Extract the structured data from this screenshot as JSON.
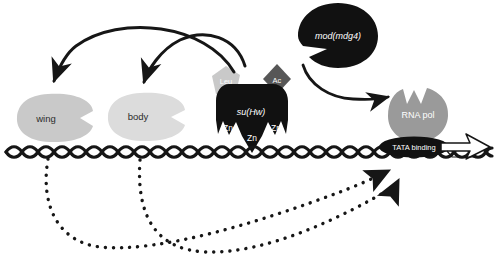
{
  "diagram": {
    "type": "biological-schematic",
    "background_color": "#ffffff"
  },
  "palette": {
    "ink": "#161616",
    "black_protein": "#111111",
    "gray_dark": "#575757",
    "gray_mid": "#9a9a9a",
    "gray_light": "#c9c9c9",
    "gray_lighter": "#dcdcdc",
    "white": "#ffffff",
    "label_dark": "#2b2b2b"
  },
  "enhancers": [
    {
      "id": "wing-enhancer",
      "label": "wing",
      "shape": "pacman-blob",
      "fill": "#c9c9c9",
      "cx": 55,
      "cy": 118,
      "rx": 38,
      "ry": 24,
      "label_x": 46,
      "label_y": 119,
      "font_size": 9.5
    },
    {
      "id": "body-enhancer",
      "label": "body",
      "shape": "pacman-blob",
      "fill": "#dcdcdc",
      "cx": 146,
      "cy": 117,
      "rx": 38,
      "ry": 24,
      "label_x": 138,
      "label_y": 117,
      "font_size": 9.5
    }
  ],
  "su_hw_complex": {
    "label": "su(Hw)",
    "label_x": 251,
    "label_y": 113,
    "font_size": 9,
    "fill": "#111111",
    "subunits": [
      {
        "id": "leu-subunit",
        "label": "Leu",
        "shape": "pentagon",
        "fill": "#c9c9c9",
        "cx": 226,
        "cy": 81,
        "r": 15,
        "label_x": 226,
        "label_y": 82,
        "font_size": 7.5,
        "label_color": "#ffffff"
      },
      {
        "id": "ac-subunit",
        "label": "Ac",
        "shape": "diamond",
        "fill": "#575757",
        "cx": 277,
        "cy": 79,
        "r": 15,
        "label_x": 277,
        "label_y": 81,
        "font_size": 7.5,
        "label_color": "#ffffff"
      }
    ],
    "zinc_fingers": [
      {
        "id": "zn-finger-left",
        "label": "Zn",
        "label_x": 228,
        "label_y": 129,
        "font_size": 8.5
      },
      {
        "id": "zn-finger-center",
        "label": "Zn",
        "label_x": 252,
        "label_y": 139,
        "font_size": 8.5
      },
      {
        "id": "zn-finger-right",
        "label": "Zn",
        "label_x": 276,
        "label_y": 129,
        "font_size": 8.5
      }
    ]
  },
  "mod_mdg4": {
    "id": "mod-mdg4-protein",
    "label": "mod(mdg4)",
    "shape": "pacman-blob",
    "fill": "#111111",
    "cx": 338,
    "cy": 35,
    "rx": 40,
    "ry": 32,
    "label_x": 338,
    "label_y": 37,
    "font_size": 9,
    "label_color": "#ffffff"
  },
  "rna_polymerase": {
    "id": "rna-pol-protein",
    "label": "RNA pol",
    "shape": "pacman-blob",
    "fill": "#9a9a9a",
    "cx": 418,
    "cy": 114,
    "rx": 30,
    "ry": 27,
    "label_x": 418,
    "label_y": 116,
    "font_size": 9,
    "label_color": "#ffffff"
  },
  "tata_binding": {
    "id": "tata-binding-factor",
    "label": "TATA binding",
    "shape": "ellipse",
    "fill": "#111111",
    "cx": 414,
    "cy": 147,
    "rx": 35,
    "ry": 10,
    "label_x": 414,
    "label_y": 148,
    "font_size": 7.5,
    "label_color": "#ffffff"
  },
  "transcription_arrow": {
    "id": "transcription-direction-arrow",
    "description": "open block arrow indicating direction of transcription",
    "fill": "#ffffff",
    "stroke": "#161616",
    "x": 442,
    "y": 148,
    "length": 46,
    "direction": "right"
  },
  "dna": {
    "id": "dna-double-helix",
    "description": "braided double helix strand",
    "y": 152,
    "x_start": 6,
    "x_end": 492,
    "period": 22,
    "amplitude": 6.5,
    "stroke": "#161616",
    "stroke_width": 3.2
  },
  "activation_arrows": [
    {
      "id": "arrow-complex-to-wing",
      "style": "solid",
      "description": "curved arrow from su(Hw) region sweeping left to wing enhancer",
      "from": [
        232,
        72
      ],
      "to": [
        54,
        83
      ],
      "arrowhead": "thin"
    },
    {
      "id": "arrow-complex-to-body",
      "style": "solid",
      "description": "curved arrow from su(Hw) region sweeping left to body enhancer",
      "from": [
        243,
        66
      ],
      "to": [
        144,
        84
      ],
      "arrowhead": "thin"
    },
    {
      "id": "arrow-modmdg4-to-rnapol",
      "style": "solid",
      "description": "curved arrow from mod(mdg4) notch to RNA polymerase",
      "from": [
        303,
        66
      ],
      "to": [
        390,
        99
      ],
      "arrowhead": "thin"
    }
  ],
  "blocked_arrows": [
    {
      "id": "dotted-arrow-wing-to-promoter",
      "style": "dotted",
      "description": "dotted looping arrow from DNA near wing enhancer to promoter region",
      "from": [
        48,
        158
      ],
      "to": [
        392,
        170
      ],
      "arrowhead": "solid"
    },
    {
      "id": "dotted-arrow-body-to-promoter",
      "style": "dotted",
      "description": "dotted looping arrow from DNA near body enhancer to promoter region",
      "from": [
        140,
        160
      ],
      "to": [
        400,
        183
      ],
      "arrowhead": "solid"
    }
  ]
}
